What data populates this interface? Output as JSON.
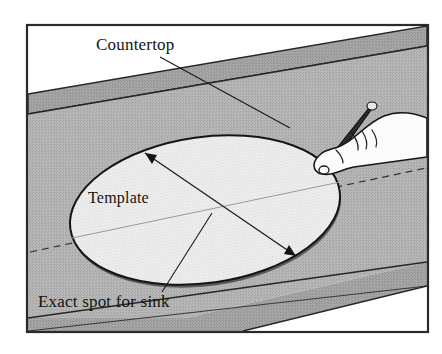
{
  "figure": {
    "background_color": "#ffffff",
    "frame": {
      "name": "illustration-border",
      "stroke_color": "#2a2a2a",
      "x": 27,
      "y": 25,
      "width": 401,
      "height": 307
    },
    "labels": [
      {
        "id": "countertop",
        "text": "Countertop",
        "x": 96,
        "y": 50,
        "anchor": "start",
        "leader_to_x": 290,
        "leader_to_y": 128
      },
      {
        "id": "template",
        "text": "Template",
        "x": 88,
        "y": 203,
        "anchor": "start"
      },
      {
        "id": "exact-spot",
        "text": "Exact spot for sink",
        "x": 38,
        "y": 307,
        "anchor": "start",
        "leader_to_x": 212,
        "leader_to_y": 213
      }
    ],
    "surfaces": {
      "backsplash_color": "#a0a0a0",
      "counter_color": "#b4b4b4",
      "front_edge_color": "#9a9a9a",
      "template_fill": "#e9e9e9",
      "template_edge_color": "#1a1a1a"
    },
    "template_ellipse": {
      "center_x": 205,
      "center_y": 210,
      "radius_x": 136,
      "radius_y": 73,
      "rotation_deg": -8
    },
    "dimension_arrow": {
      "from_x": 145,
      "from_y": 153,
      "to_x": 296,
      "to_y": 256,
      "double_headed": true
    },
    "dashed_guide": {
      "left_x": 30,
      "left_y": 252,
      "right_x": 426,
      "right_y": 168
    },
    "hand": {
      "name": "hand-holding-pencil",
      "pencil_tip_x": 322,
      "pencil_tip_y": 170
    }
  }
}
